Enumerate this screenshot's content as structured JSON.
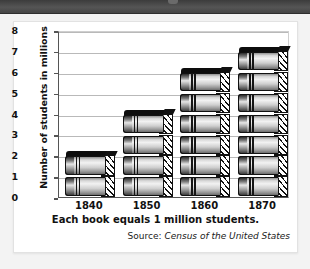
{
  "page": {
    "background_color": "#f3f3f3",
    "top_band_color": "#4a4a4a"
  },
  "card": {
    "background_color": "#ffffff",
    "border_color": "#e2e2e2"
  },
  "chart_data": {
    "type": "bar",
    "title": "",
    "subtitle": "",
    "xlabel": "Each book equals 1 million students.",
    "ylabel": "Number of students in millions",
    "categories": [
      "1840",
      "1850",
      "1860",
      "1870"
    ],
    "values": [
      2,
      4,
      6,
      7
    ],
    "ylim": [
      0,
      8
    ],
    "ytick_labels": [
      "0",
      "1",
      "2",
      "3",
      "4",
      "5",
      "6",
      "7",
      "8"
    ],
    "ytick_values": [
      0,
      1,
      2,
      3,
      4,
      5,
      6,
      7,
      8
    ],
    "grid": true,
    "grid_axis": "y",
    "legend": false,
    "legend_position": "none",
    "units": "millions of students",
    "pictograph_symbol": "book",
    "pictograph_unit_value": 1,
    "series": [
      {
        "name": "Number of students in millions",
        "values": [
          2,
          4,
          6,
          7
        ]
      }
    ],
    "annotations": [
      "Each book equals 1 million students."
    ]
  },
  "source": {
    "label": "Source:",
    "title": "Census of the United States"
  }
}
